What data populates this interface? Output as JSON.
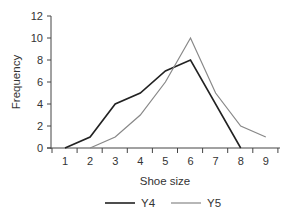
{
  "chart_data": {
    "type": "line",
    "title": "",
    "xlabel": "Shoe size",
    "ylabel": "Frequency",
    "x": [
      1,
      2,
      3,
      4,
      5,
      6,
      7,
      8,
      9
    ],
    "xticks": [
      "1",
      "2",
      "3",
      "4",
      "5",
      "6",
      "7",
      "8",
      "9"
    ],
    "yticks": [
      "0",
      "2",
      "4",
      "6",
      "8",
      "10",
      "12"
    ],
    "ylim": [
      0,
      12
    ],
    "grid": false,
    "legend_position": "bottom",
    "series": [
      {
        "name": "Y4",
        "color": "#222222",
        "x": [
          1,
          2,
          3,
          4,
          5,
          6,
          8
        ],
        "values": [
          0,
          1,
          4,
          5,
          7,
          8,
          0
        ]
      },
      {
        "name": "Y5",
        "color": "#888888",
        "x": [
          2,
          3,
          4,
          5,
          6,
          7,
          8,
          9
        ],
        "values": [
          0,
          1,
          3,
          6,
          10,
          5,
          2,
          1
        ]
      }
    ]
  },
  "legend": {
    "y4": "Y4",
    "y5": "Y5"
  },
  "axes": {
    "xlabel": "Shoe size",
    "ylabel": "Frequency"
  }
}
